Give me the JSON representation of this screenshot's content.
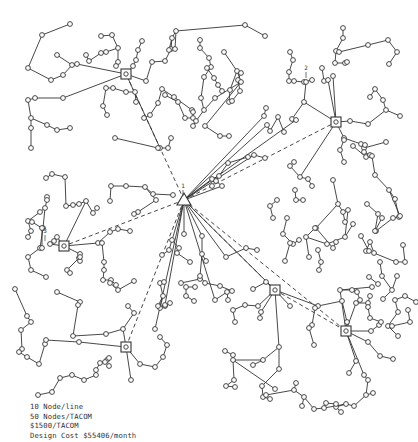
{
  "diagram": {
    "type": "network-topology",
    "center": {
      "label": "1",
      "shape": "triangle",
      "x": 184,
      "y": 200
    },
    "concentrators": [
      {
        "id": "c-nw",
        "x": 126,
        "y": 74
      },
      {
        "id": "c-ne",
        "x": 336,
        "y": 122
      },
      {
        "id": "c-w",
        "x": 64,
        "y": 246,
        "label": "3"
      },
      {
        "id": "c-se1",
        "x": 275,
        "y": 290
      },
      {
        "id": "c-se2",
        "x": 346,
        "y": 331
      },
      {
        "id": "c-sw",
        "x": 126,
        "y": 347
      }
    ],
    "node_labels": [
      {
        "text": "2",
        "x": 306,
        "y": 70
      },
      {
        "text": "3",
        "x": 45,
        "y": 233
      },
      {
        "text": "1",
        "x": 183,
        "y": 188
      }
    ],
    "colors": {
      "line": "#333333",
      "node_fill": "#ffffff",
      "background": "#ffffff"
    }
  },
  "caption": {
    "line1": "10 Node/line",
    "line2": "50 Nodes/TACOM",
    "line3": "$1500/TACOM",
    "line4": "Design Cost $55406/month"
  }
}
